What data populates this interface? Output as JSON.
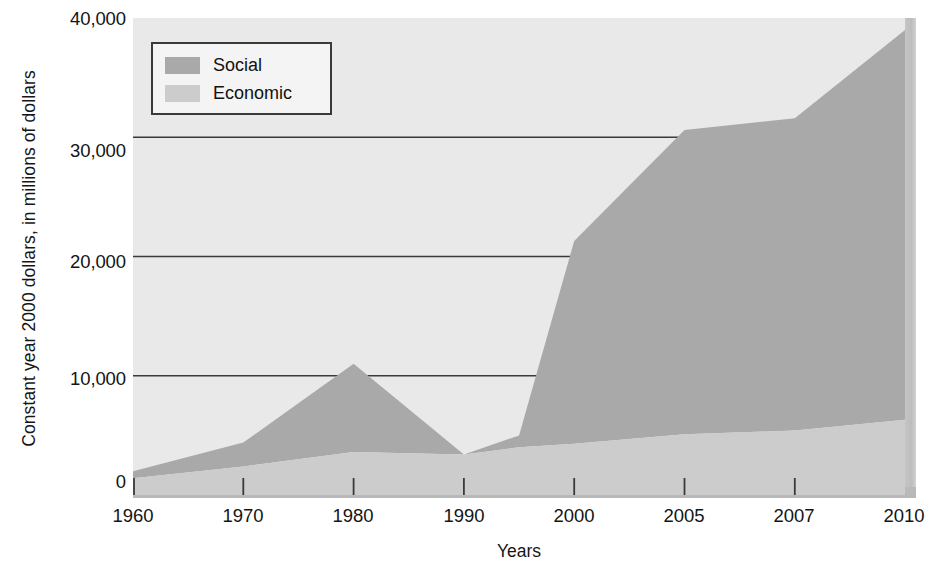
{
  "chart_data": {
    "type": "area",
    "stacked": true,
    "title": "",
    "xlabel": "Years",
    "ylabel": "Constant year 2000 dollars, in millions of dollars",
    "categories": [
      "1960",
      "1970",
      "1980",
      "1990",
      "1995",
      "2000",
      "2005",
      "2007",
      "2010"
    ],
    "x_tick_labels": [
      "1960",
      "1970",
      "1980",
      "1990",
      "2000",
      "2005",
      "2007",
      "2010"
    ],
    "y_tick_labels": [
      "0",
      "10,000",
      "20,000",
      "30,000",
      "40,000"
    ],
    "y_ticks": [
      0,
      10000,
      20000,
      30000,
      40000
    ],
    "ylim": [
      0,
      40000
    ],
    "grid": "horizontal",
    "legend_position": "top-left",
    "series": [
      {
        "name": "Social",
        "color": "#a9a9a9",
        "values": [
          600,
          2000,
          7400,
          0,
          1000,
          17000,
          25500,
          26200,
          32700
        ]
      },
      {
        "name": "Economic",
        "color": "#cccccc",
        "values": [
          1400,
          2400,
          3600,
          3400,
          4000,
          4300,
          5100,
          5400,
          6300
        ]
      }
    ],
    "totals": [
      2000,
      4400,
      11000,
      3400,
      5000,
      21300,
      30600,
      31600,
      39000
    ],
    "plot_background": "#e9e9e9",
    "gridline_color": "#3a3a3a"
  },
  "legend": {
    "items": [
      {
        "label": "Social",
        "color": "#a9a9a9"
      },
      {
        "label": "Economic",
        "color": "#cccccc"
      }
    ]
  },
  "axes": {
    "y_title": "Constant year 2000 dollars, in millions of dollars",
    "x_title": "Years",
    "y_labels": [
      "40,000",
      "30,000",
      "20,000",
      "10,000",
      "0"
    ],
    "x_labels": [
      "1960",
      "1970",
      "1980",
      "1990",
      "2000",
      "2005",
      "2007",
      "2010"
    ]
  }
}
